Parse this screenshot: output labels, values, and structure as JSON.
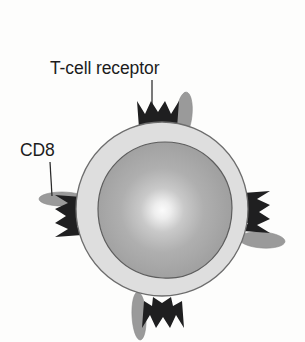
{
  "figure": {
    "background_color": "#fdfdfc"
  },
  "labels": [
    {
      "id": "t-cell-receptor",
      "text": "T-cell receptor",
      "x": 50,
      "y": 74,
      "anchor": "start",
      "leader": {
        "x1": 152,
        "y1": 80,
        "x2": 152,
        "y2": 104
      }
    },
    {
      "id": "cd8",
      "text": "CD8",
      "x": 20,
      "y": 156,
      "anchor": "start",
      "leader": {
        "x1": 50,
        "y1": 162,
        "x2": 52,
        "y2": 196
      }
    }
  ],
  "cell": {
    "name": "T lymphocyte",
    "cytoplasm_color": "#dedede",
    "membrane_stroke": "#6d6d6d",
    "cx": 162,
    "cy": 209,
    "rx": 86,
    "ry": 87,
    "nucleus": {
      "cx": 165,
      "cy": 210,
      "rx": 67,
      "ry": 68,
      "fill_center": "#f2f2f2",
      "fill_mid": "#a8a8a8",
      "fill_edge": "#9a9a9a",
      "highlight_cx": 162,
      "highlight_cy": 210
    }
  },
  "receptors": [
    {
      "id": "receptor-top",
      "angle": 0,
      "cx": 158,
      "cy": 115,
      "color": "#1f1f20"
    },
    {
      "id": "receptor-left",
      "angle": -90,
      "cx": 69,
      "cy": 216,
      "color": "#1f1f20"
    },
    {
      "id": "receptor-right",
      "angle": 90,
      "cx": 256,
      "cy": 212,
      "color": "#1f1f20"
    },
    {
      "id": "receptor-bottom",
      "angle": 180,
      "cx": 163,
      "cy": 314,
      "color": "#1f1f20"
    }
  ],
  "cd8_molecules": [
    {
      "id": "cd8-top",
      "cx": 184,
      "cy": 115,
      "rx": 8,
      "ry": 23,
      "angle": 6,
      "color": "#9a9a9a"
    },
    {
      "id": "cd8-left",
      "cx": 62,
      "cy": 199,
      "rx": 23,
      "ry": 7,
      "angle": 0,
      "color": "#9a9a9a"
    },
    {
      "id": "cd8-right",
      "cx": 262,
      "cy": 240,
      "rx": 23,
      "ry": 8,
      "angle": 4,
      "color": "#9a9a9a"
    },
    {
      "id": "cd8-bottom",
      "cx": 139,
      "cy": 316,
      "rx": 7,
      "ry": 24,
      "angle": -3,
      "color": "#9a9a9a"
    }
  ]
}
